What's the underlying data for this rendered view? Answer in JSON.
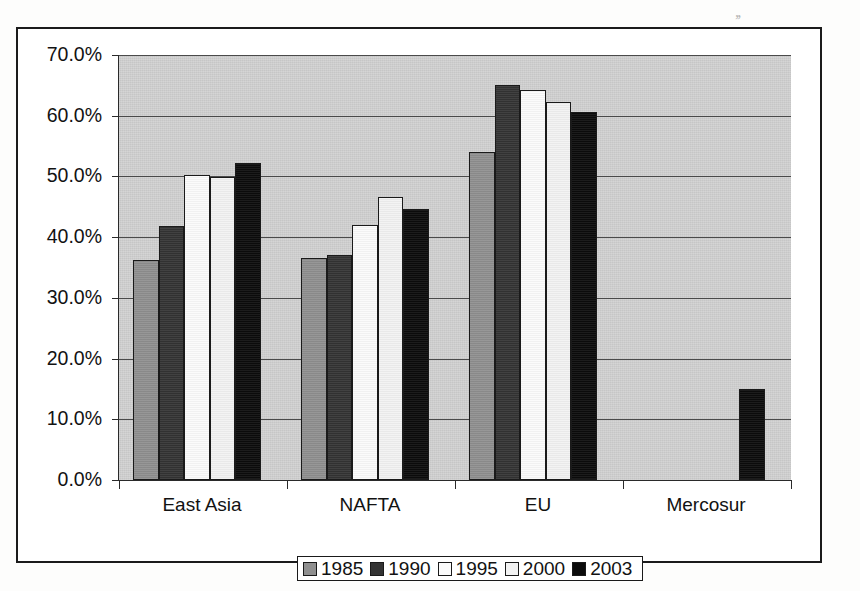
{
  "scan_artifact": ",,",
  "chart_data": {
    "type": "bar",
    "title": "",
    "subtitle": "",
    "xlabel": "",
    "ylabel": "",
    "grid": true,
    "legend_position": "bottom",
    "ylim": [
      0,
      70
    ],
    "ytick_labels": [
      "70.0%",
      "60.0%",
      "50.0%",
      "40.0%",
      "30.0%",
      "20.0%",
      "10.0%",
      "0.0%"
    ],
    "ytick_values": [
      70,
      60,
      50,
      40,
      30,
      20,
      10,
      0
    ],
    "categories": [
      "East Asia",
      "NAFTA",
      "EU",
      "Mercosur"
    ],
    "series": [
      {
        "name": "1985",
        "color": "#8f8f8f",
        "values": [
          36.2,
          36.6,
          54.0,
          null
        ]
      },
      {
        "name": "1990",
        "color": "#333333",
        "values": [
          41.8,
          37.0,
          65.0,
          null
        ]
      },
      {
        "name": "1995",
        "color": "#fbfbfb",
        "values": [
          50.2,
          42.0,
          64.2,
          null
        ]
      },
      {
        "name": "2000",
        "color": "#f2f2f2",
        "values": [
          49.9,
          46.6,
          62.2,
          null
        ]
      },
      {
        "name": "2003",
        "color": "#0b0b0b",
        "values": [
          52.2,
          44.6,
          60.6,
          15.0
        ]
      }
    ],
    "plot_background": "#c6c6c6",
    "frame_color": "#1b1b1b"
  }
}
